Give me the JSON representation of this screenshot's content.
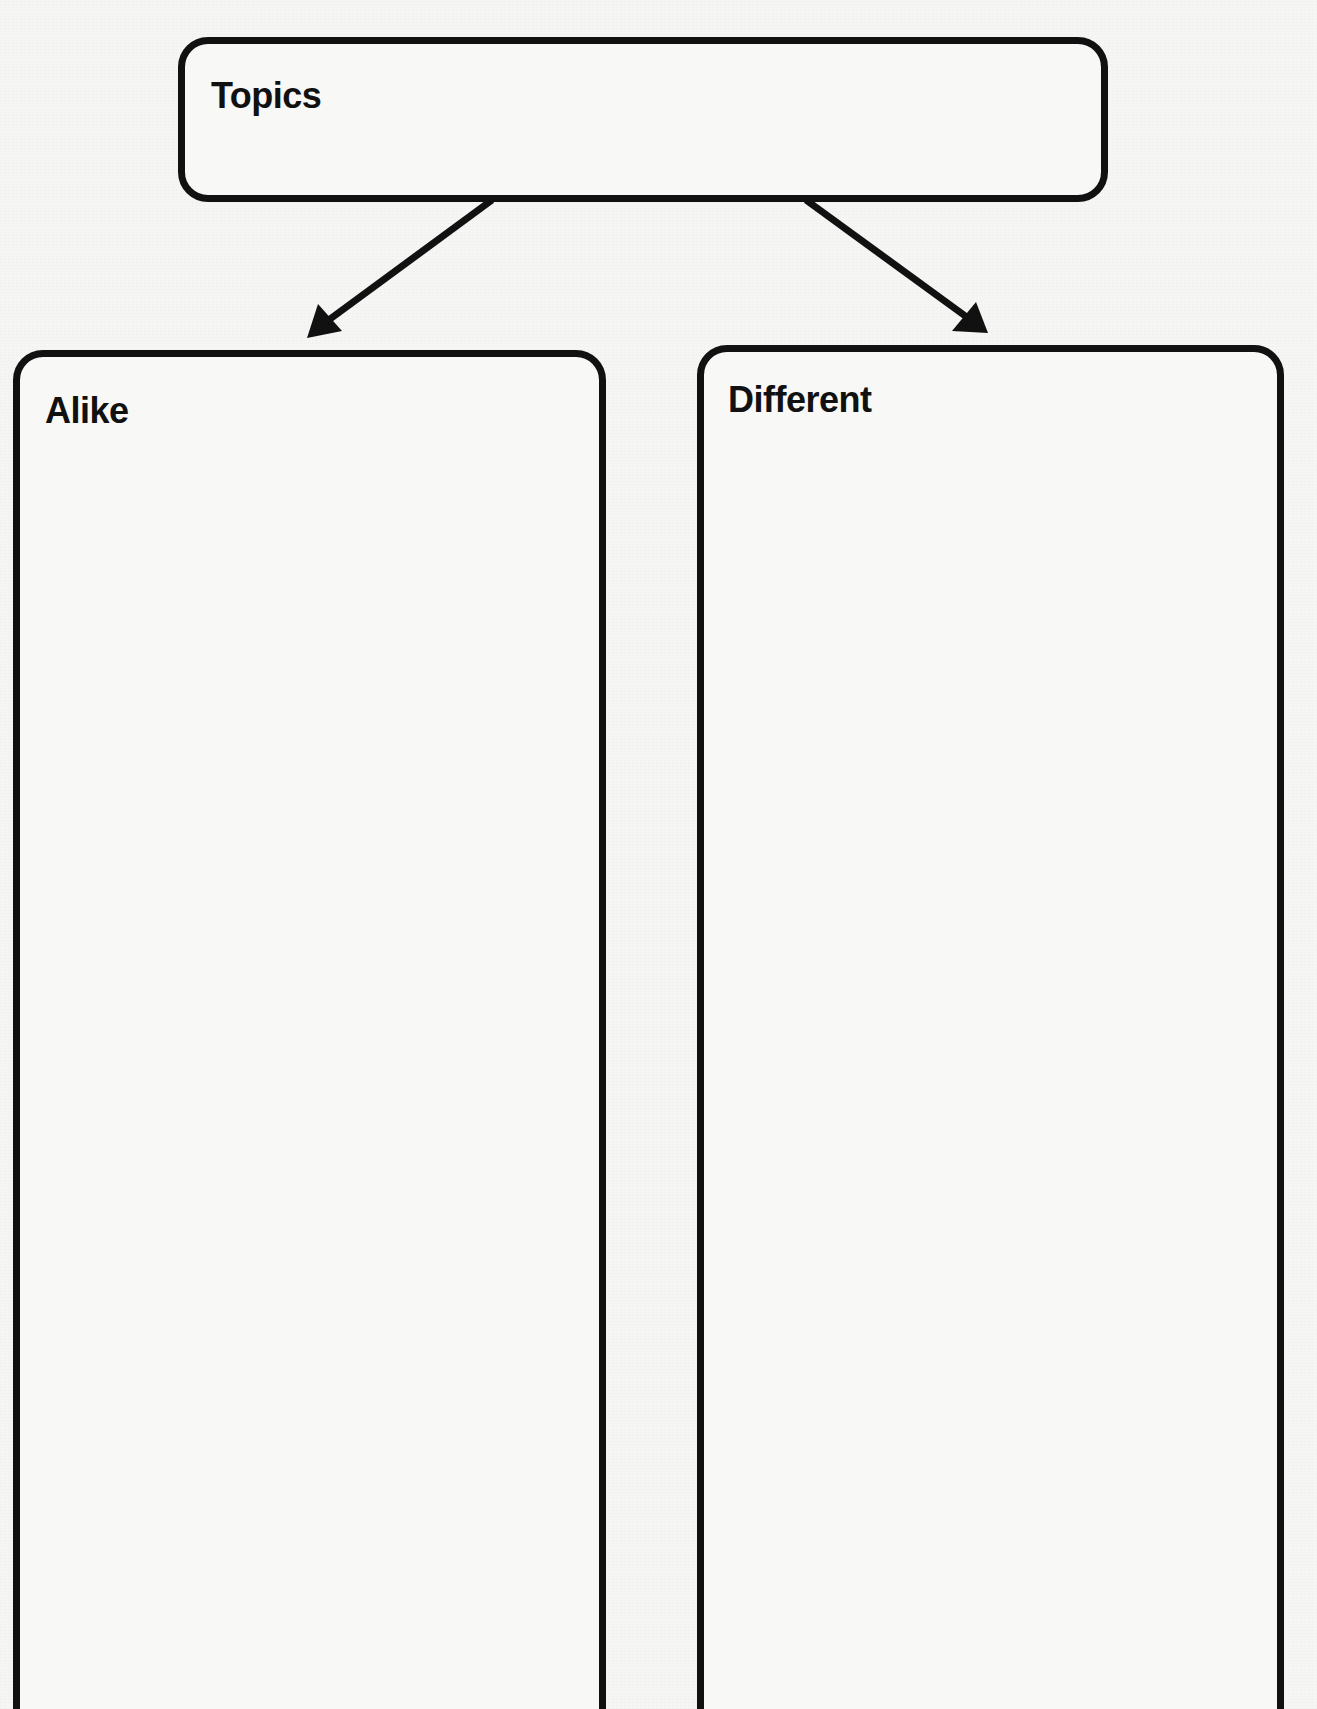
{
  "diagram": {
    "type": "compare-contrast-graphic-organizer",
    "background_color": "#f6f6f4",
    "stroke_color": "#111111",
    "topics": {
      "label": "Topics",
      "value": ""
    },
    "alike": {
      "label": "Alike",
      "value": ""
    },
    "different": {
      "label": "Different",
      "value": ""
    },
    "connectors": [
      {
        "from": "topics",
        "to": "alike",
        "icon": "arrow-down-left-icon"
      },
      {
        "from": "topics",
        "to": "different",
        "icon": "arrow-down-right-icon"
      }
    ]
  }
}
